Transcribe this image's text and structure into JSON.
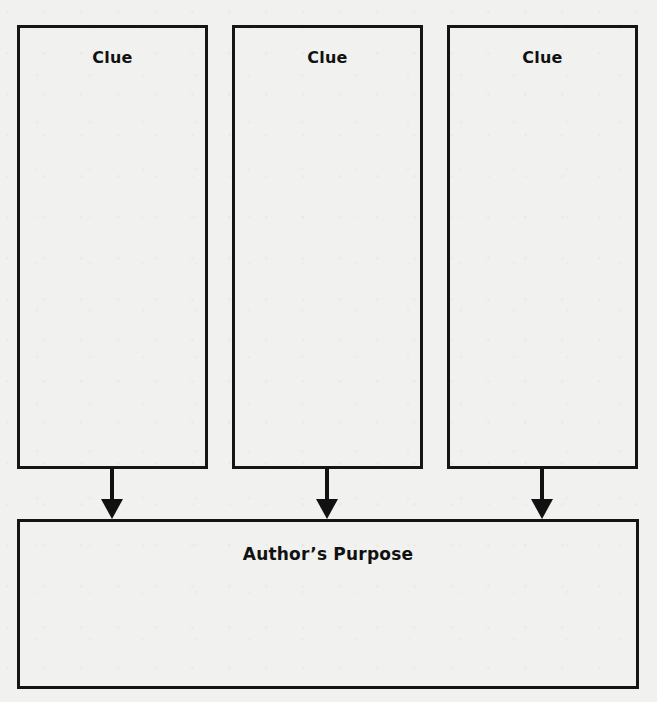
{
  "organizer": {
    "clues": [
      {
        "label": "Clue"
      },
      {
        "label": "Clue"
      },
      {
        "label": "Clue"
      }
    ],
    "result": {
      "label": "Author’s Purpose"
    }
  },
  "colors": {
    "ink": "#111111",
    "paper": "#f1f1ef"
  }
}
